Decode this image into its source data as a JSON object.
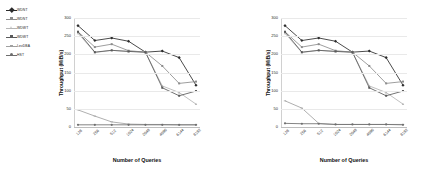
{
  "legend": {
    "items": [
      {
        "label": "WDNT",
        "color": "#2b2b2b",
        "marker": "diamond"
      },
      {
        "label": "WDNT",
        "color": "#8c8c8c",
        "marker": "square"
      },
      {
        "label": "WDWT",
        "color": "#b5b5b5",
        "marker": "triangle"
      },
      {
        "label": "WDWT",
        "color": "#5a5a5a",
        "marker": "square"
      },
      {
        "label": "LevDBA",
        "color": "#a0a0a0",
        "marker": "cross"
      },
      {
        "label": "HST",
        "color": "#6e6e6e",
        "marker": "circle"
      }
    ]
  },
  "chart_data": [
    {
      "type": "line",
      "title": "",
      "xlabel": "Number of Queries",
      "ylabel": "Throughput (MiB/s)",
      "categories": [
        "128",
        "256",
        "512",
        "1024",
        "2048",
        "4096",
        "6144",
        "8192"
      ],
      "ylim": [
        0,
        300
      ],
      "yticks": [
        0,
        50,
        100,
        150,
        200,
        250,
        300
      ],
      "grid": true,
      "legend_position": "outside-left",
      "series": [
        {
          "name": "WDNT",
          "color": "#2b2b2b",
          "marker": "diamond",
          "values": [
            279,
            238,
            245,
            236,
            206,
            209,
            191,
            115
          ]
        },
        {
          "name": "WDNT",
          "color": "#8c8c8c",
          "marker": "square",
          "values": [
            262,
            220,
            228,
            210,
            206,
            168,
            120,
            125
          ]
        },
        {
          "name": "WDWT",
          "color": "#b5b5b5",
          "marker": "triangle",
          "values": [
            258,
            205,
            211,
            208,
            206,
            113,
            95,
            63
          ]
        },
        {
          "name": "WDWT",
          "color": "#5a5a5a",
          "marker": "square",
          "values": [
            262,
            206,
            211,
            208,
            206,
            108,
            86,
            99
          ]
        },
        {
          "name": "LevDBA",
          "color": "#a0a0a0",
          "marker": "cross",
          "values": [
            47,
            30,
            14,
            8,
            7,
            7,
            6,
            6
          ]
        },
        {
          "name": "HST",
          "color": "#6e6e6e",
          "marker": "circle",
          "values": [
            6,
            6,
            6,
            6,
            6,
            6,
            6,
            6
          ]
        }
      ]
    },
    {
      "type": "line",
      "title": "",
      "xlabel": "Number of Queries",
      "ylabel": "Throughput (MiB/s)",
      "categories": [
        "128",
        "256",
        "512",
        "1024",
        "2048",
        "4096",
        "6144",
        "8192"
      ],
      "ylim": [
        0,
        300
      ],
      "yticks": [
        0,
        50,
        100,
        150,
        200,
        250,
        300
      ],
      "grid": true,
      "legend_position": "none",
      "series": [
        {
          "name": "WDNT",
          "color": "#2b2b2b",
          "marker": "diamond",
          "values": [
            279,
            238,
            245,
            236,
            206,
            209,
            191,
            115
          ]
        },
        {
          "name": "WDNT",
          "color": "#8c8c8c",
          "marker": "square",
          "values": [
            262,
            220,
            228,
            210,
            206,
            168,
            120,
            125
          ]
        },
        {
          "name": "WDWT",
          "color": "#b5b5b5",
          "marker": "triangle",
          "values": [
            258,
            205,
            211,
            208,
            206,
            113,
            95,
            63
          ]
        },
        {
          "name": "WDWT",
          "color": "#5a5a5a",
          "marker": "square",
          "values": [
            262,
            206,
            211,
            208,
            206,
            108,
            86,
            99
          ]
        },
        {
          "name": "LevDBA",
          "color": "#a0a0a0",
          "marker": "cross",
          "values": [
            72,
            52,
            10,
            7,
            7,
            7,
            7,
            7
          ]
        },
        {
          "name": "HST",
          "color": "#6e6e6e",
          "marker": "circle",
          "values": [
            10,
            9,
            9,
            7,
            7,
            7,
            7,
            6
          ]
        }
      ]
    }
  ]
}
